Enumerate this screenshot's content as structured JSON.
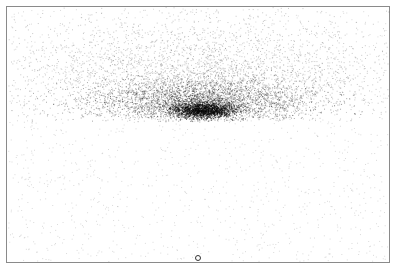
{
  "chart_data": {
    "type": "scatter",
    "title": "",
    "xlabel": "",
    "ylabel": "",
    "grid": false,
    "legend": null,
    "frame": {
      "left": 6,
      "top": 6,
      "right": 390,
      "bottom": 263
    },
    "point_color": "#000000",
    "frame_color": "#8a8a8a",
    "clusters": [
      {
        "name": "dense-core",
        "cx": 203,
        "cy": 110,
        "sx": 16,
        "sy": 4,
        "n": 1800,
        "alpha": 0.55
      },
      {
        "name": "band",
        "cx": 200,
        "cy": 100,
        "sx": 55,
        "sy": 11,
        "n": 3000,
        "alpha": 0.35
      },
      {
        "name": "halo",
        "cx": 200,
        "cy": 78,
        "sx": 95,
        "sy": 30,
        "n": 3500,
        "alpha": 0.22
      },
      {
        "name": "background",
        "uniform": true,
        "n": 1500,
        "alpha": 0.15
      }
    ],
    "lower_cutoff_y": 119,
    "marker": {
      "x": 198,
      "y": 258,
      "shape": "open-circle"
    },
    "seed": 12345
  }
}
